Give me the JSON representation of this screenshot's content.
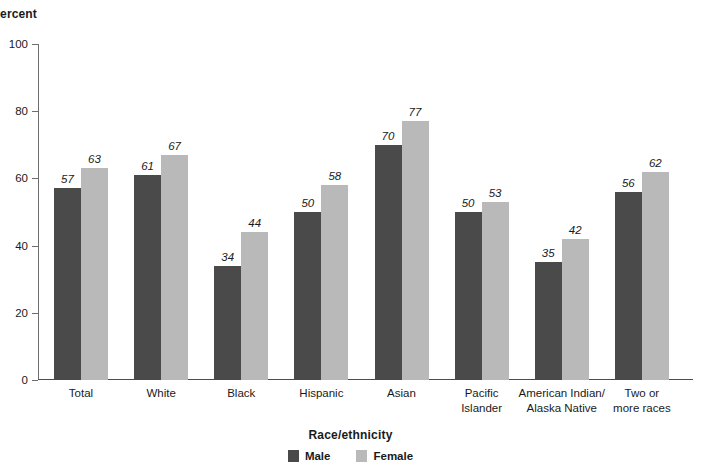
{
  "chart_data": {
    "type": "bar",
    "title": "",
    "xlabel": "Race/ethnicity",
    "ylabel": "Percent",
    "ylim": [
      0,
      100
    ],
    "yticks": [
      0,
      20,
      40,
      60,
      80,
      100
    ],
    "grid": false,
    "legend_position": "bottom",
    "categories": [
      "Total",
      "White",
      "Black",
      "Hispanic",
      "Asian",
      "Pacific\nIslander",
      "American Indian/\nAlaska Native",
      "Two or\nmore races"
    ],
    "series": [
      {
        "name": "Male",
        "color": "#4a4a4a",
        "values": [
          57,
          61,
          34,
          50,
          70,
          50,
          35,
          56
        ]
      },
      {
        "name": "Female",
        "color": "#b9b9b9",
        "values": [
          63,
          67,
          44,
          58,
          77,
          53,
          42,
          62
        ]
      }
    ]
  }
}
